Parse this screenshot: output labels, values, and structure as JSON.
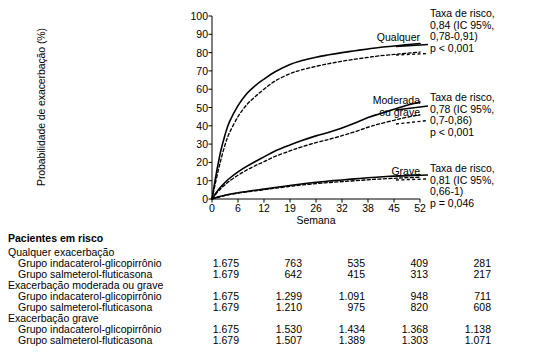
{
  "chart_data": {
    "type": "line",
    "title": "",
    "xlabel": "Semana",
    "ylabel": "Probabilidade de exacerbação (%)",
    "xticks": [
      "0",
      "6",
      "12",
      "19",
      "26",
      "32",
      "38",
      "45",
      "52"
    ],
    "yticks": [
      "0",
      "10",
      "20",
      "30",
      "40",
      "50",
      "60",
      "70",
      "80",
      "90",
      "100"
    ],
    "xlim": [
      0,
      52
    ],
    "ylim": [
      0,
      100
    ],
    "grid": false,
    "legend_position": "inline-right",
    "x": [
      0,
      1,
      2,
      3,
      4,
      6,
      8,
      10,
      12,
      15,
      19,
      22,
      26,
      29,
      32,
      35,
      38,
      41,
      45,
      48,
      52
    ],
    "series": [
      {
        "name": "Qualquer exacerbação — Grupo indacaterol-glicopirrônio",
        "style": "solid",
        "values": [
          0,
          14,
          26,
          35,
          42,
          51,
          57.5,
          62,
          65.5,
          69.5,
          73.5,
          75.5,
          77.5,
          78.8,
          80,
          81,
          82,
          82.8,
          83.6,
          84.2,
          85
        ]
      },
      {
        "name": "Qualquer exacerbação — Grupo salmeterol-fluticasona",
        "style": "dashed",
        "values": [
          0,
          11,
          21,
          29.5,
          36,
          45,
          51.5,
          56,
          60,
          64.5,
          68.5,
          70.5,
          72.5,
          74,
          75.3,
          76.4,
          77.4,
          78.2,
          79,
          79.6,
          80.3
        ]
      },
      {
        "name": "Exacerbação moderada ou grave — Grupo indacaterol-glicopirrônio",
        "style": "solid",
        "values": [
          0,
          3.5,
          6.5,
          9,
          11.2,
          14.8,
          17.8,
          20.5,
          23,
          26.2,
          29.5,
          31.8,
          34.5,
          36.5,
          38.8,
          41.5,
          44.5,
          46.5,
          49,
          51,
          53
        ]
      },
      {
        "name": "Exacerbação moderada ou grave — Grupo salmeterol-fluticasona",
        "style": "dashed",
        "values": [
          0,
          3,
          5.6,
          7.8,
          9.8,
          13,
          15.8,
          18.2,
          20.4,
          23.3,
          26.3,
          28.4,
          30.8,
          32.6,
          34.6,
          36.8,
          39.2,
          41,
          43,
          44.5,
          46
        ]
      },
      {
        "name": "Exacerbação grave — Grupo indacaterol-glicopirrônio",
        "style": "solid",
        "values": [
          0,
          0.8,
          1.5,
          2.1,
          2.6,
          3.4,
          4.1,
          4.8,
          5.4,
          6.3,
          7.4,
          8.2,
          9.1,
          9.8,
          10.4,
          11,
          11.6,
          12,
          12.5,
          12.8,
          13.2
        ]
      },
      {
        "name": "Exacerbação grave — Grupo salmeterol-fluticasona",
        "style": "dashed",
        "values": [
          0,
          0.7,
          1.3,
          1.9,
          2.4,
          3.2,
          3.9,
          4.5,
          5.1,
          5.9,
          6.9,
          7.6,
          8.4,
          9,
          9.5,
          10,
          10.5,
          10.9,
          11.3,
          11.6,
          11.9
        ]
      }
    ],
    "annotations": [
      {
        "curve_label": "Qualquer",
        "hazard_lines": [
          "Taxa de risco,",
          "0,84 (IC 95%,",
          "0,78-0,91)",
          "p < 0,001"
        ]
      },
      {
        "curve_label_line1": "Moderada",
        "curve_label_line2": "ou grave",
        "hazard_lines": [
          "Taxa de risco,",
          "0,78 (IC 95%,",
          "0,7-0,86)",
          "p < 0,001"
        ]
      },
      {
        "curve_label": "Grave",
        "hazard_lines": [
          "Taxa de risco,",
          "0,81 (IC 95%,",
          "0,66-1)",
          "p = 0,046"
        ]
      }
    ]
  },
  "risk_table": {
    "title": "Pacientes em risco",
    "groups": [
      {
        "heading": "Qualquer exacerbação",
        "rows": [
          {
            "label": "Grupo indacaterol-glicopirrônio",
            "values": [
              "1.675",
              "763",
              "535",
              "409",
              "281"
            ]
          },
          {
            "label": "Grupo salmeterol-fluticasona",
            "values": [
              "1.679",
              "642",
              "415",
              "313",
              "217"
            ]
          }
        ]
      },
      {
        "heading": "Exacerbação moderada ou grave",
        "rows": [
          {
            "label": "Grupo indacaterol-glicopirrônio",
            "values": [
              "1.675",
              "1.299",
              "1.091",
              "948",
              "711"
            ]
          },
          {
            "label": "Grupo salmeterol-fluticasona",
            "values": [
              "1.679",
              "1.210",
              "975",
              "820",
              "608"
            ]
          }
        ]
      },
      {
        "heading": "Exacerbação grave",
        "rows": [
          {
            "label": "Grupo indacaterol-glicopirrônio",
            "values": [
              "1.675",
              "1.530",
              "1.434",
              "1.368",
              "1.138"
            ]
          },
          {
            "label": "Grupo salmeterol-fluticasona",
            "values": [
              "1.679",
              "1.507",
              "1.389",
              "1.303",
              "1.071"
            ]
          }
        ]
      }
    ]
  }
}
